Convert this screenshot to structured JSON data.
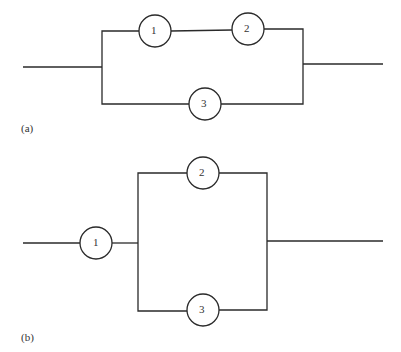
{
  "diagram_a": {
    "label": "(a)",
    "nodes": [
      {
        "id": "1",
        "label": "1"
      },
      {
        "id": "2",
        "label": "2"
      },
      {
        "id": "3",
        "label": "3"
      }
    ],
    "description": "Components 1 and 2 in series, in parallel with component 3"
  },
  "diagram_b": {
    "label": "(b)",
    "nodes": [
      {
        "id": "1",
        "label": "1"
      },
      {
        "id": "2",
        "label": "2"
      },
      {
        "id": "3",
        "label": "3"
      }
    ],
    "description": "Component 1 in series with parallel combination of components 2 and 3"
  },
  "colors": {
    "line": "#2a2a2a",
    "text": "#333333"
  }
}
